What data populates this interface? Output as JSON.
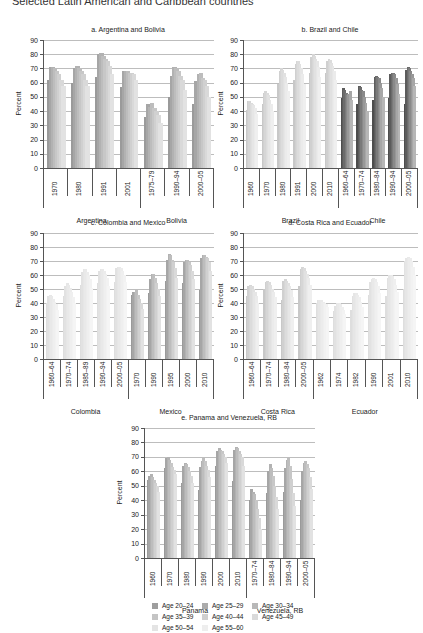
{
  "figure": {
    "title": "Selected Latin American and Caribbean countries"
  },
  "legend": {
    "items": [
      {
        "label": "Age 20–24",
        "color": "#9e9e9e"
      },
      {
        "label": "Age 25–29",
        "color": "#ababab"
      },
      {
        "label": "Age 30–34",
        "color": "#b8b8b8"
      },
      {
        "label": "Age 35–39",
        "color": "#c4c4c4"
      },
      {
        "label": "Age 40–44",
        "color": "#cfcfcf"
      },
      {
        "label": "Age 45–49",
        "color": "#dadada"
      },
      {
        "label": "Age 50–54",
        "color": "#e4e4e4"
      },
      {
        "label": "Age 55–60",
        "color": "#eeeeee"
      }
    ]
  },
  "chart_data": [
    {
      "type": "bar",
      "title": "a. Argentina and Bolivia",
      "ylabel": "Percent",
      "ylim": [
        0,
        90
      ],
      "yticks": [
        0,
        10,
        20,
        30,
        40,
        50,
        60,
        70,
        80,
        90
      ],
      "grid": true,
      "groups": [
        {
          "country": "Argentina",
          "categories": [
            "1970",
            "1980",
            "1991",
            "2001"
          ]
        },
        {
          "country": "Bolivia",
          "categories": [
            "1975–79",
            "1990–94",
            "2000–05"
          ]
        }
      ],
      "series_names": [
        "Age 20–24",
        "Age 25–29",
        "Age 30–34",
        "Age 35–39",
        "Age 40–44",
        "Age 45–49",
        "Age 50–54",
        "Age 55–60"
      ],
      "values": [
        [
          62,
          71,
          71,
          70,
          68,
          66,
          62,
          58
        ],
        [
          60,
          70,
          72,
          70,
          68,
          66,
          62,
          58
        ],
        [
          64,
          80,
          81,
          79,
          77,
          75,
          72,
          66
        ],
        [
          57,
          68,
          68,
          68,
          67,
          67,
          66,
          62
        ],
        [
          36,
          45,
          43,
          46,
          42,
          40,
          37,
          32
        ],
        [
          50,
          65,
          71,
          70,
          68,
          65,
          62,
          55
        ],
        [
          45,
          61,
          66,
          67,
          63,
          62,
          58,
          50
        ]
      ]
    },
    {
      "type": "bar",
      "title": "b. Brazil and Chile",
      "ylabel": "Percent",
      "ylim": [
        0,
        90
      ],
      "yticks": [
        0,
        10,
        20,
        30,
        40,
        50,
        60,
        70,
        80,
        90
      ],
      "grid": true,
      "groups": [
        {
          "country": "Brazil",
          "categories": [
            "1960",
            "1970",
            "1980",
            "1991",
            "2000",
            "2010"
          ]
        },
        {
          "country": "Chile",
          "categories": [
            "1960–64",
            "1970–74",
            "1980–84",
            "1990–94",
            "2000–05"
          ]
        }
      ],
      "series_names": [
        "Age 20–24",
        "Age 25–29",
        "Age 30–34",
        "Age 35–39",
        "Age 40–44",
        "Age 45–49",
        "Age 50–54",
        "Age 55–60"
      ],
      "values": [
        [
          41,
          47,
          47,
          46,
          45,
          44,
          42,
          38
        ],
        [
          45,
          53,
          54,
          53,
          51,
          48,
          45,
          40
        ],
        [
          59,
          68,
          70,
          69,
          67,
          64,
          60,
          54
        ],
        [
          62,
          73,
          75,
          75,
          73,
          70,
          66,
          59
        ],
        [
          67,
          78,
          80,
          79,
          77,
          75,
          71,
          64
        ],
        [
          67,
          75,
          77,
          76,
          74,
          72,
          68,
          62
        ],
        [
          49,
          56,
          55,
          53,
          51,
          52,
          54,
          48
        ],
        [
          45,
          58,
          57,
          55,
          54,
          50,
          46,
          40
        ],
        [
          48,
          64,
          65,
          64,
          63,
          60,
          56,
          50
        ],
        [
          49,
          66,
          67,
          67,
          66,
          63,
          59,
          52
        ],
        [
          45,
          69,
          71,
          70,
          68,
          66,
          63,
          58
        ]
      ]
    },
    {
      "type": "bar",
      "title": "c. Colombia and Mexico",
      "ylabel": "Percent",
      "ylim": [
        0,
        90
      ],
      "yticks": [
        0,
        10,
        20,
        30,
        40,
        50,
        60,
        70,
        80,
        90
      ],
      "grid": true,
      "groups": [
        {
          "country": "Colombia",
          "categories": [
            "1960–64",
            "1970–74",
            "1985–89",
            "1990–94",
            "2000–05"
          ]
        },
        {
          "country": "Mexico",
          "categories": [
            "1970",
            "1990",
            "1995",
            "2000",
            "2010"
          ]
        }
      ],
      "series_names": [
        "Age 20–24",
        "Age 25–29",
        "Age 30–34",
        "Age 35–39",
        "Age 40–44",
        "Age 45–49",
        "Age 50–54",
        "Age 55–60"
      ],
      "values": [
        [
          40,
          45,
          46,
          45,
          43,
          41,
          39,
          35
        ],
        [
          45,
          52,
          54,
          53,
          51,
          48,
          44,
          40
        ],
        [
          53,
          62,
          64,
          64,
          62,
          60,
          57,
          51
        ],
        [
          54,
          63,
          64,
          64,
          63,
          61,
          58,
          52
        ],
        [
          55,
          65,
          66,
          66,
          65,
          63,
          60,
          55
        ],
        [
          46,
          48,
          48,
          49,
          46,
          43,
          40,
          36
        ],
        [
          47,
          57,
          61,
          61,
          58,
          54,
          50,
          45
        ],
        [
          56,
          71,
          75,
          74,
          71,
          69,
          65,
          58
        ],
        [
          54,
          69,
          71,
          71,
          69,
          67,
          63,
          57
        ],
        [
          49,
          72,
          74,
          74,
          73,
          72,
          69,
          63
        ]
      ]
    },
    {
      "type": "bar",
      "title": "d. Costa Rica and Ecuador",
      "ylabel": "Percent",
      "ylim": [
        0,
        90
      ],
      "yticks": [
        0,
        10,
        20,
        30,
        40,
        50,
        60,
        70,
        80,
        90
      ],
      "grid": true,
      "groups": [
        {
          "country": "Costa Rica",
          "categories": [
            "1960–64",
            "1970–74",
            "1980–84",
            "2000–05"
          ]
        },
        {
          "country": "Ecuador",
          "categories": [
            "1962",
            "1974",
            "1982",
            "1990",
            "2001",
            "2010"
          ]
        }
      ],
      "series_names": [
        "Age 20–24",
        "Age 25–29",
        "Age 30–34",
        "Age 35–39",
        "Age 40–44",
        "Age 45–49",
        "Age 50–54",
        "Age 55–60"
      ],
      "values": [
        [
          45,
          52,
          53,
          52,
          50,
          48,
          45,
          40
        ],
        [
          50,
          55,
          56,
          55,
          53,
          50,
          48,
          44
        ],
        [
          42,
          56,
          57,
          56,
          54,
          52,
          49,
          44
        ],
        [
          52,
          64,
          66,
          65,
          63,
          61,
          58,
          53
        ],
        [
          40,
          42,
          42,
          42,
          41,
          40,
          39,
          37
        ],
        [
          34,
          38,
          40,
          40,
          39,
          37,
          35,
          32
        ],
        [
          35,
          45,
          47,
          47,
          46,
          44,
          41,
          37
        ],
        [
          46,
          55,
          57,
          58,
          57,
          55,
          52,
          47
        ],
        [
          45,
          58,
          60,
          60,
          59,
          57,
          53,
          48
        ],
        [
          50,
          70,
          72,
          73,
          72,
          70,
          66,
          60
        ]
      ]
    },
    {
      "type": "bar",
      "title": "e. Panama and Venezuela, RB",
      "ylabel": "Percent",
      "ylim": [
        0,
        90
      ],
      "yticks": [
        0,
        10,
        20,
        30,
        40,
        50,
        60,
        70,
        80,
        90
      ],
      "grid": true,
      "groups": [
        {
          "country": "Panama",
          "categories": [
            "1960",
            "1970",
            "1980",
            "1990",
            "2000",
            "2010"
          ]
        },
        {
          "country": "Venezuela, RB",
          "categories": [
            "1970–74",
            "1980–84",
            "1990–94",
            "2000–05"
          ]
        }
      ],
      "series_names": [
        "Age 20–24",
        "Age 25–29",
        "Age 30–34",
        "Age 35–39",
        "Age 40–44",
        "Age 45–49",
        "Age 50–54",
        "Age 55–60"
      ],
      "values": [
        [
          54,
          57,
          58,
          56,
          54,
          52,
          50,
          46
        ],
        [
          62,
          69,
          70,
          68,
          66,
          63,
          61,
          58
        ],
        [
          52,
          64,
          66,
          65,
          63,
          60,
          57,
          52
        ],
        [
          47,
          63,
          67,
          69,
          67,
          64,
          61,
          56
        ],
        [
          64,
          74,
          76,
          75,
          74,
          72,
          70,
          66
        ],
        [
          53,
          75,
          77,
          76,
          74,
          72,
          70,
          64
        ],
        [
          40,
          48,
          46,
          44,
          40,
          34,
          28,
          20
        ],
        [
          45,
          60,
          65,
          62,
          57,
          50,
          42,
          34
        ],
        [
          46,
          62,
          68,
          69,
          64,
          55,
          45,
          36
        ],
        [
          40,
          60,
          66,
          67,
          65,
          62,
          56,
          48
        ]
      ]
    }
  ]
}
